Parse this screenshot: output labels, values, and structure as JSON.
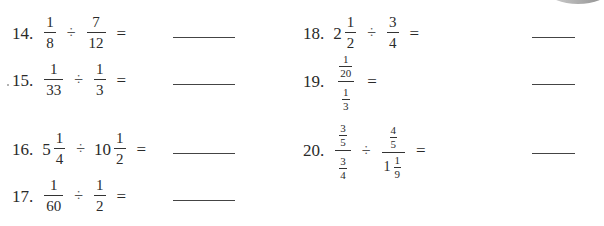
{
  "problems": [
    {
      "number": "14.",
      "a": {
        "n": "1",
        "d": "8"
      },
      "op": "÷",
      "b": {
        "n": "7",
        "d": "12"
      },
      "eq": "="
    },
    {
      "number": "15.",
      "a": {
        "n": "1",
        "d": "33"
      },
      "op": "÷",
      "b": {
        "n": "1",
        "d": "3"
      },
      "eq": "="
    },
    {
      "number": "16.",
      "a": {
        "whole": "5",
        "n": "1",
        "d": "4"
      },
      "op": "÷",
      "b": {
        "whole": "10",
        "n": "1",
        "d": "2"
      },
      "eq": "="
    },
    {
      "number": "17.",
      "a": {
        "n": "1",
        "d": "60"
      },
      "op": "÷",
      "b": {
        "n": "1",
        "d": "2"
      },
      "eq": "="
    },
    {
      "number": "18.",
      "a": {
        "whole": "2",
        "n": "1",
        "d": "2"
      },
      "op": "÷",
      "b": {
        "n": "3",
        "d": "4"
      },
      "eq": "="
    },
    {
      "number": "19.",
      "top": {
        "n": "1",
        "d": "20"
      },
      "bottom": {
        "n": "1",
        "d": "3"
      },
      "eq": "="
    },
    {
      "number": "20.",
      "a_top": {
        "n": "3",
        "d": "5"
      },
      "a_bottom": {
        "n": "3",
        "d": "4"
      },
      "op": "÷",
      "b_top": {
        "n": "4",
        "d": "5"
      },
      "b_bottom": {
        "whole": "1",
        "n": "1",
        "d": "9"
      },
      "eq": "="
    }
  ],
  "colors": {
    "text": "#2a2a2a",
    "line": "#444444",
    "tab": "#8e8e8e"
  }
}
